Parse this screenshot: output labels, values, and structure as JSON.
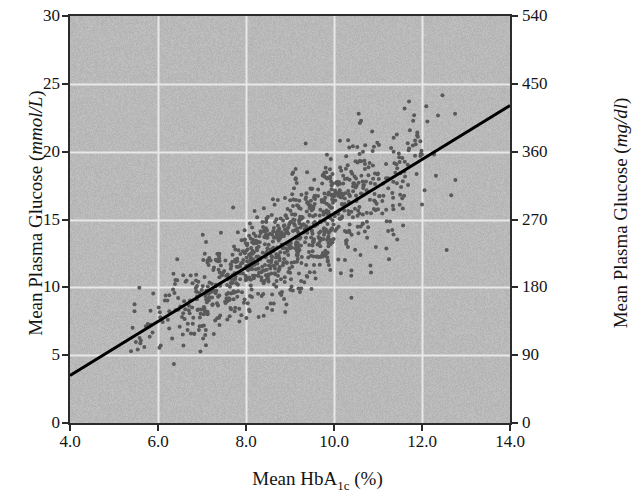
{
  "chart_data": {
    "type": "scatter",
    "title": "",
    "xlabel": "Mean HbA1c (%)",
    "xlabel_parts": {
      "prefix": "Mean HbA",
      "subscript": "1c",
      "suffix": " (%)"
    },
    "ylabel": "Mean Plasma Glucose (mmol/L)",
    "ylabel_parts": {
      "prefix": "Mean Plasma Glucose (",
      "units": "mmol/L",
      "suffix": ")"
    },
    "ylabel_right": "Mean Plasma Glucose (mg/dl)",
    "ylabel_right_parts": {
      "prefix": "Mean Plasma Glucose (",
      "units": "mg/dl",
      "suffix": ")"
    },
    "xlim": [
      4.0,
      14.0
    ],
    "ylim": [
      0,
      30
    ],
    "ylim_right": [
      0,
      540
    ],
    "xticks": [
      "4.0",
      "6.0",
      "8.0",
      "10.0",
      "12.0",
      "14.0"
    ],
    "xtick_values": [
      4.0,
      6.0,
      8.0,
      10.0,
      12.0,
      14.0
    ],
    "yticks_left": [
      "0",
      "5",
      "10",
      "15",
      "20",
      "25",
      "30"
    ],
    "ytick_values_left": [
      0,
      5,
      10,
      15,
      20,
      25,
      30
    ],
    "yticks_right": [
      "0",
      "90",
      "180",
      "270",
      "360",
      "450",
      "540"
    ],
    "ytick_values_right": [
      0,
      90,
      180,
      270,
      360,
      450,
      540
    ],
    "grid": true,
    "grid_color": "#e8e8e8",
    "plot_background": "#b9b9b9",
    "point_color": "#595959",
    "point_size_px": 4,
    "line_color": "#000000",
    "line_width_px": 3,
    "legend": "none",
    "n_points": 1000,
    "regression_line": {
      "x_start": 4.0,
      "y_start": 3.5,
      "x_end": 14.0,
      "y_end": 23.4,
      "slope": 1.99,
      "intercept": -4.46
    },
    "scatter_distribution": {
      "x_mean": 8.9,
      "x_sd": 1.55,
      "x_min": 5.3,
      "x_max": 13.1,
      "residual_sd": 2.5,
      "y_min": 4.2,
      "y_max": 28.5,
      "seed": 20240117
    }
  }
}
